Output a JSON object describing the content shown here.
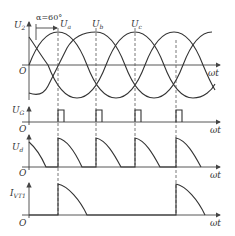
{
  "figure": {
    "alpha_label": "α=60°",
    "origin_label": "O",
    "x_axis_label": "ωt",
    "panels": [
      {
        "name": "supply-voltage",
        "y_label": "U",
        "y_sub": "2",
        "phase_labels": [
          {
            "main": "U",
            "sub": "a"
          },
          {
            "main": "U",
            "sub": "b"
          },
          {
            "main": "U",
            "sub": "c"
          }
        ]
      },
      {
        "name": "gate-pulses",
        "y_label": "U",
        "y_sub": "G"
      },
      {
        "name": "output-voltage",
        "y_label": "U",
        "y_sub": "d"
      },
      {
        "name": "thyristor-current",
        "y_label": "I",
        "y_sub": "VT1"
      }
    ]
  },
  "colors": {
    "line": "#333333",
    "background": "#ffffff"
  }
}
